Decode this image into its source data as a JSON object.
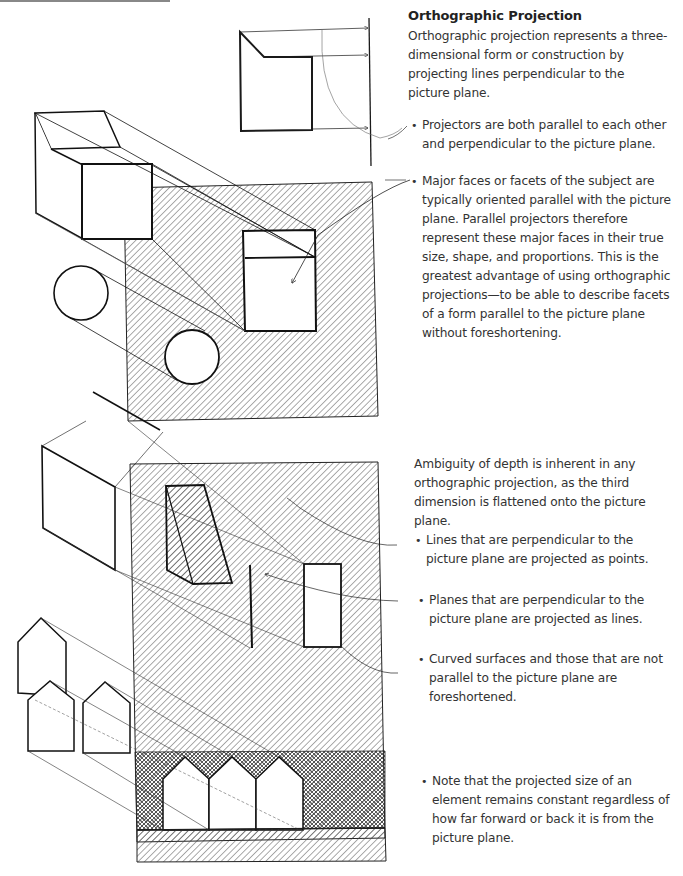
{
  "page": {
    "title": "Orthographic Projection",
    "intro": "Orthographic projection represents a three-dimensional form or construction by projecting lines perpendicular to the picture plane."
  },
  "annotations": [
    {
      "id": "projectors",
      "text": "Projectors are both parallel to each other and perpendicular to the picture plane."
    },
    {
      "id": "major-faces",
      "text": "Major faces or facets of the subject are typically oriented parallel with the picture plane. Parallel projectors therefore represent these major faces in their true size, shape, and proportions. This is the greatest advantage of using orthographic projections—to be able to describe facets of a form parallel to the picture plane without foreshortening."
    },
    {
      "id": "ambiguity",
      "text": "Ambiguity of depth is inherent in any orthographic projection, as the third dimension is flattened onto the picture plane."
    },
    {
      "id": "lines-points",
      "text": "Lines that are perpendicular to the picture plane are projected as points."
    },
    {
      "id": "planes-lines",
      "text": "Planes that are perpendicular to the picture plane are projected as lines."
    },
    {
      "id": "curved",
      "text": "Curved surfaces and those that are not parallel to the picture plane are foreshortened."
    },
    {
      "id": "note",
      "text": "Note that the projected size of an element remains constant regardless of how far forward or back it is from the picture plane."
    }
  ],
  "figures": [
    {
      "id": "profile-diagram",
      "description": "side profile of block with projectors to vertical picture plane"
    },
    {
      "id": "block-cylinders-projection",
      "description": "block and cylinders projected onto hatched picture plane"
    },
    {
      "id": "planes-houses-projection",
      "description": "planes and house shapes projected onto hatched picture plane"
    }
  ],
  "colors": {
    "ink": "#1a1a1a",
    "hatch": "#555555",
    "text": "#333333"
  }
}
